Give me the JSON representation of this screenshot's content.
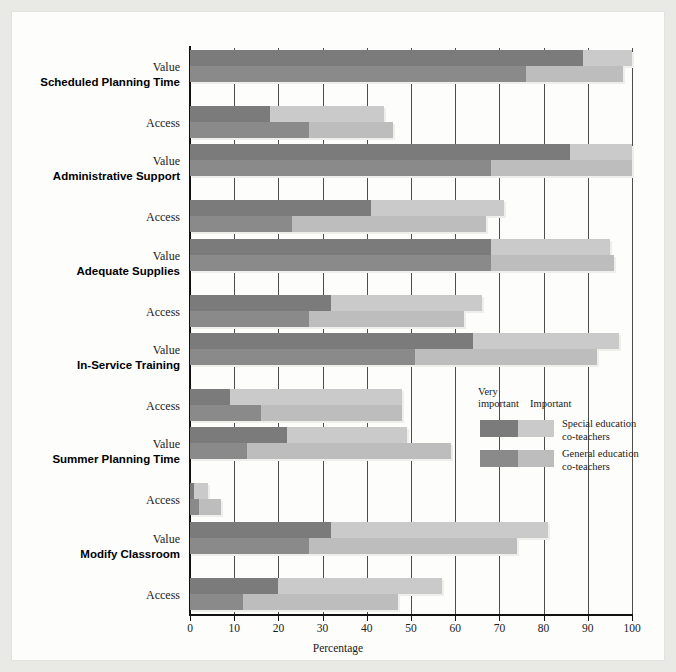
{
  "chart_data": {
    "type": "bar",
    "orientation": "horizontal",
    "title": "",
    "xlabel": "Percentage",
    "ylabel": "",
    "xlim": [
      0,
      100
    ],
    "xticks": [
      0,
      10,
      20,
      30,
      40,
      50,
      60,
      70,
      80,
      90,
      100
    ],
    "grid": true,
    "stacked": true,
    "legend": {
      "position": "inside-right",
      "segment_headers": [
        "Very\nimportant",
        "Important"
      ],
      "series": [
        {
          "name": "Special education\nco-teachers",
          "very_important_color": "#7b7b7b",
          "important_color": "#cacaca"
        },
        {
          "name": "General education\nco-teachers",
          "very_important_color": "#8a8a8a",
          "important_color": "#bdbdbd"
        }
      ]
    },
    "groups": [
      {
        "label": "Scheduled Planning Time",
        "rows": [
          {
            "label": "Value",
            "bars": [
              {
                "series": "Special education co-teachers",
                "very_important": 89,
                "important": 11,
                "total": 100
              },
              {
                "series": "General education co-teachers",
                "very_important": 76,
                "important": 22,
                "total": 98
              }
            ]
          },
          {
            "label": "Access",
            "bars": [
              {
                "series": "Special education co-teachers",
                "very_important": 18,
                "important": 26,
                "total": 44
              },
              {
                "series": "General education co-teachers",
                "very_important": 27,
                "important": 19,
                "total": 46
              }
            ]
          }
        ]
      },
      {
        "label": "Administrative Support",
        "rows": [
          {
            "label": "Value",
            "bars": [
              {
                "series": "Special education co-teachers",
                "very_important": 86,
                "important": 14,
                "total": 100
              },
              {
                "series": "General education co-teachers",
                "very_important": 68,
                "important": 32,
                "total": 100
              }
            ]
          },
          {
            "label": "Access",
            "bars": [
              {
                "series": "Special education co-teachers",
                "very_important": 41,
                "important": 30,
                "total": 71
              },
              {
                "series": "General education co-teachers",
                "very_important": 23,
                "important": 44,
                "total": 67
              }
            ]
          }
        ]
      },
      {
        "label": "Adequate Supplies",
        "rows": [
          {
            "label": "Value",
            "bars": [
              {
                "series": "Special education co-teachers",
                "very_important": 68,
                "important": 27,
                "total": 95
              },
              {
                "series": "General education co-teachers",
                "very_important": 68,
                "important": 28,
                "total": 96
              }
            ]
          },
          {
            "label": "Access",
            "bars": [
              {
                "series": "Special education co-teachers",
                "very_important": 32,
                "important": 34,
                "total": 66
              },
              {
                "series": "General education co-teachers",
                "very_important": 27,
                "important": 35,
                "total": 62
              }
            ]
          }
        ]
      },
      {
        "label": "In-Service Training",
        "rows": [
          {
            "label": "Value",
            "bars": [
              {
                "series": "Special education co-teachers",
                "very_important": 64,
                "important": 33,
                "total": 97
              },
              {
                "series": "General education co-teachers",
                "very_important": 51,
                "important": 41,
                "total": 92
              }
            ]
          },
          {
            "label": "Access",
            "bars": [
              {
                "series": "Special education co-teachers",
                "very_important": 9,
                "important": 39,
                "total": 48
              },
              {
                "series": "General education co-teachers",
                "very_important": 16,
                "important": 32,
                "total": 48
              }
            ]
          }
        ]
      },
      {
        "label": "Summer Planning Time",
        "rows": [
          {
            "label": "Value",
            "bars": [
              {
                "series": "Special education co-teachers",
                "very_important": 22,
                "important": 27,
                "total": 49
              },
              {
                "series": "General education co-teachers",
                "very_important": 13,
                "important": 46,
                "total": 59
              }
            ]
          },
          {
            "label": "Access",
            "bars": [
              {
                "series": "Special education co-teachers",
                "very_important": 1,
                "important": 3,
                "total": 4
              },
              {
                "series": "General education co-teachers",
                "very_important": 2,
                "important": 5,
                "total": 7
              }
            ]
          }
        ]
      },
      {
        "label": "Modify Classroom",
        "rows": [
          {
            "label": "Value",
            "bars": [
              {
                "series": "Special education co-teachers",
                "very_important": 32,
                "important": 49,
                "total": 81
              },
              {
                "series": "General education co-teachers",
                "very_important": 27,
                "important": 47,
                "total": 74
              }
            ]
          },
          {
            "label": "Access",
            "bars": [
              {
                "series": "Special education co-teachers",
                "very_important": 20,
                "important": 37,
                "total": 57
              },
              {
                "series": "General education co-teachers",
                "very_important": 12,
                "important": 35,
                "total": 47
              }
            ]
          }
        ]
      }
    ]
  }
}
